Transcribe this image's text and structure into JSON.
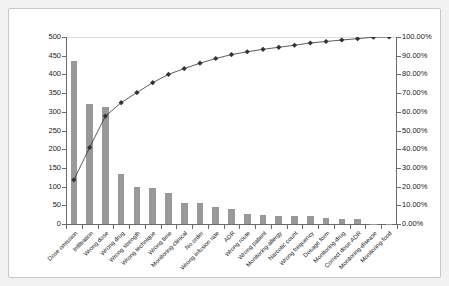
{
  "chart_data": {
    "type": "bar",
    "title": "",
    "subtitle": "",
    "xlabel": "",
    "ylabel": "",
    "y2label": "",
    "ylim": [
      0,
      500
    ],
    "y2lim": [
      0,
      100
    ],
    "grid": false,
    "legend": "none",
    "categories": [
      "Dose omission",
      "Infiltration",
      "Wrong dose",
      "Wrong drug",
      "Wrong strength",
      "Wrong technique",
      "Wrong time",
      "Monitoring-clinical",
      "No order",
      "Wrong infusion rate",
      "ADR",
      "Wrong route",
      "Wrong patient",
      "Monitoring-allergy",
      "Narcotic count",
      "Wrong frequency",
      "Dosage form",
      "Monitoring-drug",
      "Correct dose-ADR",
      "Monitoring-disease",
      "Monitoring-food"
    ],
    "series": [
      {
        "name": "Count",
        "type": "bar",
        "axis": "left",
        "color": "#999999",
        "values": [
          437,
          321,
          312,
          135,
          100,
          97,
          82,
          57,
          55,
          45,
          39,
          28,
          24,
          21,
          21,
          21,
          16,
          14,
          13,
          1,
          1
        ]
      },
      {
        "name": "Cumulative %",
        "type": "line",
        "axis": "right",
        "color": "#333333",
        "marker": "diamond",
        "values": [
          23.6,
          40.9,
          57.7,
          64.9,
          70.3,
          75.6,
          80.0,
          83.1,
          86.0,
          88.5,
          90.6,
          92.1,
          93.4,
          94.5,
          95.6,
          96.8,
          97.6,
          98.4,
          99.1,
          99.9,
          100.0
        ]
      }
    ],
    "y_ticks_left": [
      "500",
      "450",
      "400",
      "350",
      "300",
      "250",
      "200",
      "150",
      "100",
      "50",
      "0"
    ],
    "y_ticks_right": [
      "100.00%",
      "90.00%",
      "80.00%",
      "70.00%",
      "60.00%",
      "50.00%",
      "40.00%",
      "30.00%",
      "20.00%",
      "10.00%",
      "0.00%"
    ]
  }
}
